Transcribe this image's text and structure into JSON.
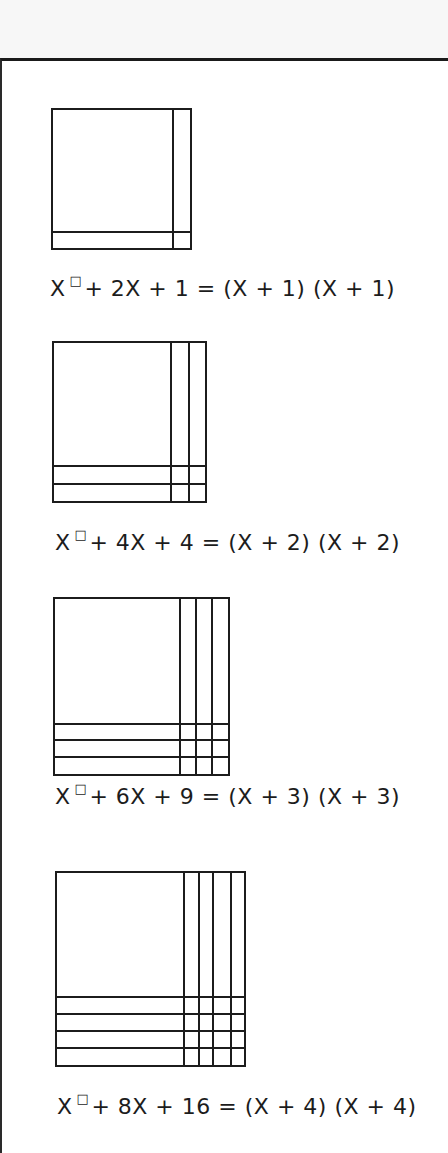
{
  "diagram": {
    "topic": "Perfect-square trinomial factoring with algebra tiles",
    "exponent_glyph": "□",
    "panels": [
      {
        "n": 1,
        "lhs_prefix": "X",
        "lhs_rest": "+ 2X + 1",
        "equals": "=",
        "rhs": "(X + 1) (X + 1)",
        "box": {
          "x": 52,
          "y": 109,
          "w": 139,
          "h": 140
        },
        "verticals": [
          173
        ],
        "horizontals": [
          232
        ]
      },
      {
        "n": 2,
        "lhs_prefix": "X",
        "lhs_rest": "+ 4X + 4",
        "equals": "=",
        "rhs": "(X + 2) (X + 2)",
        "box": {
          "x": 53,
          "y": 342,
          "w": 153,
          "h": 160
        },
        "verticals": [
          171,
          189
        ],
        "horizontals": [
          466,
          484
        ]
      },
      {
        "n": 3,
        "lhs_prefix": "X",
        "lhs_rest": "+ 6X + 9",
        "equals": "=",
        "rhs": "(X + 3) (X + 3)",
        "box": {
          "x": 54,
          "y": 598,
          "w": 175,
          "h": 177
        },
        "verticals": [
          180,
          196,
          212
        ],
        "horizontals": [
          724,
          740,
          757
        ]
      },
      {
        "n": 4,
        "lhs_prefix": "X",
        "lhs_rest": "+ 8X + 16",
        "equals": "=",
        "rhs": "(X + 4) (X + 4)",
        "box": {
          "x": 56,
          "y": 872,
          "w": 189,
          "h": 194
        },
        "verticals": [
          184,
          199,
          213,
          231
        ],
        "horizontals": [
          997,
          1014,
          1031,
          1048
        ]
      }
    ],
    "equation_positions": [
      {
        "x": 50,
        "y": 276
      },
      {
        "x": 55,
        "y": 530
      },
      {
        "x": 55,
        "y": 784
      },
      {
        "x": 57,
        "y": 1094
      }
    ]
  }
}
